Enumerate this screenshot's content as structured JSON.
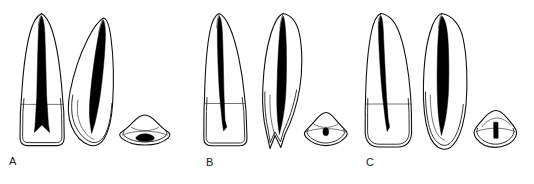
{
  "figure": {
    "background_color": "#ffffff",
    "line_color": "#111111",
    "pulp_color": "#000000",
    "width": 534,
    "height": 184
  },
  "groups": [
    {
      "id": "a",
      "label": "A",
      "label_x": 9,
      "label_y": 156,
      "views": [
        {
          "name": "labial-view",
          "x": 12,
          "y": 13,
          "width": 58,
          "height": 134
        },
        {
          "name": "proximal-view",
          "x": 70,
          "y": 14,
          "width": 52,
          "height": 132
        },
        {
          "name": "cross-section-view",
          "x": 119,
          "y": 113,
          "width": 52,
          "height": 33
        }
      ]
    },
    {
      "id": "b",
      "label": "B",
      "label_x": 206,
      "label_y": 157,
      "views": [
        {
          "name": "labial-view",
          "x": 205,
          "y": 13,
          "width": 52,
          "height": 136
        },
        {
          "name": "proximal-view",
          "x": 259,
          "y": 13,
          "width": 48,
          "height": 140
        },
        {
          "name": "cross-section-view",
          "x": 303,
          "y": 112,
          "width": 46,
          "height": 36
        }
      ]
    },
    {
      "id": "c",
      "label": "C",
      "label_x": 366,
      "label_y": 157,
      "views": [
        {
          "name": "labial-view",
          "x": 366,
          "y": 13,
          "width": 52,
          "height": 136
        },
        {
          "name": "proximal-view",
          "x": 420,
          "y": 13,
          "width": 50,
          "height": 140
        },
        {
          "name": "cross-section-view",
          "x": 473,
          "y": 110,
          "width": 46,
          "height": 40
        }
      ]
    }
  ]
}
